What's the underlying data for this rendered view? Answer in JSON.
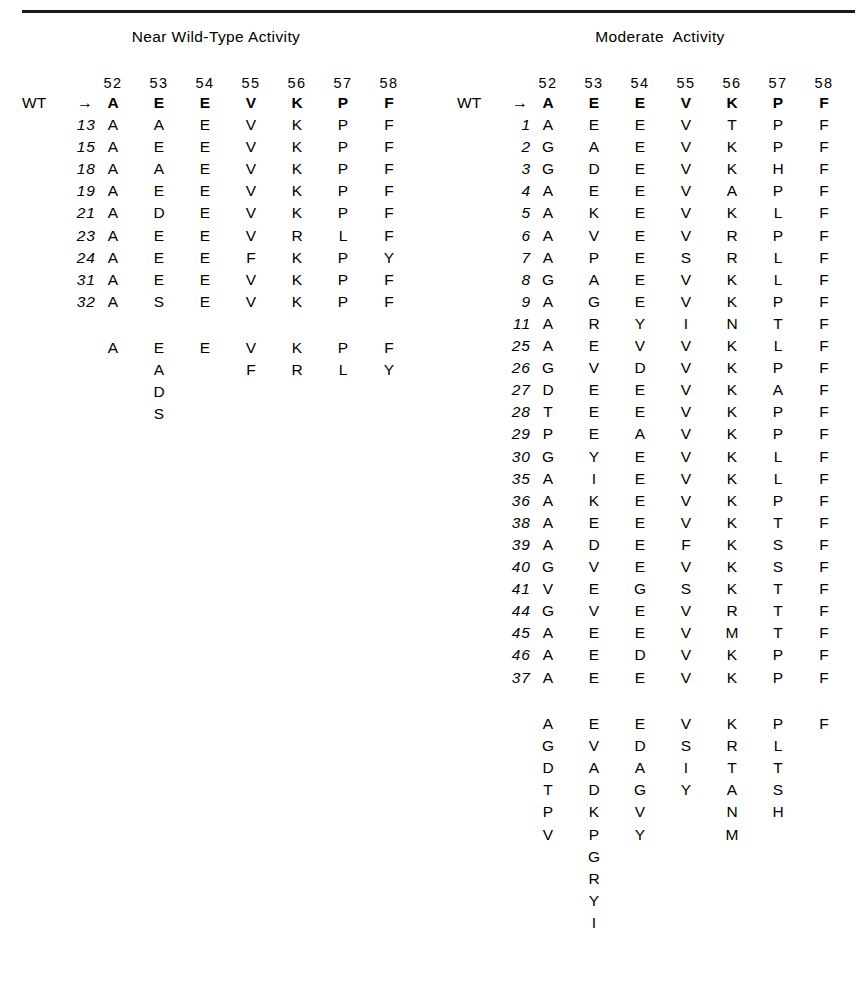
{
  "figure": {
    "panels": [
      {
        "id": "near-wild-type",
        "title": "Near Wild-Type Activity",
        "positions": [
          "52",
          "53",
          "54",
          "55",
          "56",
          "57",
          "58"
        ],
        "wt_label": "WT",
        "arrow": "→",
        "wt_sequence": [
          "A",
          "E",
          "E",
          "V",
          "K",
          "P",
          "F"
        ],
        "rows": [
          {
            "id": "13",
            "seq": [
              "A",
              "A",
              "E",
              "V",
              "K",
              "P",
              "F"
            ]
          },
          {
            "id": "15",
            "seq": [
              "A",
              "E",
              "E",
              "V",
              "K",
              "P",
              "F"
            ]
          },
          {
            "id": "18",
            "seq": [
              "A",
              "A",
              "E",
              "V",
              "K",
              "P",
              "F"
            ]
          },
          {
            "id": "19",
            "seq": [
              "A",
              "E",
              "E",
              "V",
              "K",
              "P",
              "F"
            ]
          },
          {
            "id": "21",
            "seq": [
              "A",
              "D",
              "E",
              "V",
              "K",
              "P",
              "F"
            ]
          },
          {
            "id": "23",
            "seq": [
              "A",
              "E",
              "E",
              "V",
              "R",
              "L",
              "F"
            ]
          },
          {
            "id": "24",
            "seq": [
              "A",
              "E",
              "E",
              "F",
              "K",
              "P",
              "Y"
            ]
          },
          {
            "id": "31",
            "seq": [
              "A",
              "E",
              "E",
              "V",
              "K",
              "P",
              "F"
            ]
          },
          {
            "id": "32",
            "seq": [
              "A",
              "S",
              "E",
              "V",
              "K",
              "P",
              "F"
            ]
          }
        ],
        "summary": [
          [
            "A"
          ],
          [
            "E",
            "A",
            "D",
            "S"
          ],
          [
            "E"
          ],
          [
            "V",
            "F"
          ],
          [
            "K",
            "R"
          ],
          [
            "P",
            "L"
          ],
          [
            "F",
            "Y"
          ]
        ]
      },
      {
        "id": "moderate",
        "title": "Moderate  Activity",
        "positions": [
          "52",
          "53",
          "54",
          "55",
          "56",
          "57",
          "58"
        ],
        "wt_label": "WT",
        "arrow": "→",
        "wt_sequence": [
          "A",
          "E",
          "E",
          "V",
          "K",
          "P",
          "F"
        ],
        "rows": [
          {
            "id": "1",
            "seq": [
              "A",
              "E",
              "E",
              "V",
              "T",
              "P",
              "F"
            ]
          },
          {
            "id": "2",
            "seq": [
              "G",
              "A",
              "E",
              "V",
              "K",
              "P",
              "F"
            ]
          },
          {
            "id": "3",
            "seq": [
              "G",
              "D",
              "E",
              "V",
              "K",
              "H",
              "F"
            ]
          },
          {
            "id": "4",
            "seq": [
              "A",
              "E",
              "E",
              "V",
              "A",
              "P",
              "F"
            ]
          },
          {
            "id": "5",
            "seq": [
              "A",
              "K",
              "E",
              "V",
              "K",
              "L",
              "F"
            ]
          },
          {
            "id": "6",
            "seq": [
              "A",
              "V",
              "E",
              "V",
              "R",
              "P",
              "F"
            ]
          },
          {
            "id": "7",
            "seq": [
              "A",
              "P",
              "E",
              "S",
              "R",
              "L",
              "F"
            ]
          },
          {
            "id": "8",
            "seq": [
              "G",
              "A",
              "E",
              "V",
              "K",
              "L",
              "F"
            ]
          },
          {
            "id": "9",
            "seq": [
              "A",
              "G",
              "E",
              "V",
              "K",
              "P",
              "F"
            ]
          },
          {
            "id": "11",
            "seq": [
              "A",
              "R",
              "Y",
              "I",
              "N",
              "T",
              "F"
            ]
          },
          {
            "id": "25",
            "seq": [
              "A",
              "E",
              "V",
              "V",
              "K",
              "L",
              "F"
            ]
          },
          {
            "id": "26",
            "seq": [
              "G",
              "V",
              "D",
              "V",
              "K",
              "P",
              "F"
            ]
          },
          {
            "id": "27",
            "seq": [
              "D",
              "E",
              "E",
              "V",
              "K",
              "A",
              "F"
            ]
          },
          {
            "id": "28",
            "seq": [
              "T",
              "E",
              "E",
              "V",
              "K",
              "P",
              "F"
            ]
          },
          {
            "id": "29",
            "seq": [
              "P",
              "E",
              "A",
              "V",
              "K",
              "P",
              "F"
            ]
          },
          {
            "id": "30",
            "seq": [
              "G",
              "Y",
              "E",
              "V",
              "K",
              "L",
              "F"
            ]
          },
          {
            "id": "35",
            "seq": [
              "A",
              "I",
              "E",
              "V",
              "K",
              "L",
              "F"
            ]
          },
          {
            "id": "36",
            "seq": [
              "A",
              "K",
              "E",
              "V",
              "K",
              "P",
              "F"
            ]
          },
          {
            "id": "38",
            "seq": [
              "A",
              "E",
              "E",
              "V",
              "K",
              "T",
              "F"
            ]
          },
          {
            "id": "39",
            "seq": [
              "A",
              "D",
              "E",
              "F",
              "K",
              "S",
              "F"
            ]
          },
          {
            "id": "40",
            "seq": [
              "G",
              "V",
              "E",
              "V",
              "K",
              "S",
              "F"
            ]
          },
          {
            "id": "41",
            "seq": [
              "V",
              "E",
              "G",
              "S",
              "K",
              "T",
              "F"
            ]
          },
          {
            "id": "44",
            "seq": [
              "G",
              "V",
              "E",
              "V",
              "R",
              "T",
              "F"
            ]
          },
          {
            "id": "45",
            "seq": [
              "A",
              "E",
              "E",
              "V",
              "M",
              "T",
              "F"
            ]
          },
          {
            "id": "46",
            "seq": [
              "A",
              "E",
              "D",
              "V",
              "K",
              "P",
              "F"
            ]
          },
          {
            "id": "37",
            "seq": [
              "A",
              "E",
              "E",
              "V",
              "K",
              "P",
              "F"
            ]
          }
        ],
        "summary": [
          [
            "A",
            "G",
            "D",
            "T",
            "P",
            "V"
          ],
          [
            "E",
            "V",
            "A",
            "D",
            "K",
            "P",
            "G",
            "R",
            "Y",
            "I"
          ],
          [
            "E",
            "D",
            "A",
            "G",
            "V",
            "Y"
          ],
          [
            "V",
            "S",
            "I",
            "Y"
          ],
          [
            "K",
            "R",
            "T",
            "A",
            "N",
            "M"
          ],
          [
            "P",
            "L",
            "T",
            "S",
            "H"
          ],
          [
            "F"
          ]
        ]
      }
    ]
  },
  "colors": {
    "ink": "#000000",
    "rule": "#1a1a1a",
    "background": "#ffffff"
  }
}
